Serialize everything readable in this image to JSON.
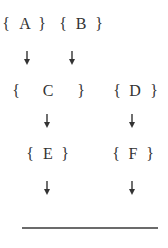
{
  "diagram": {
    "type": "flow",
    "nodes": [
      {
        "id": "A",
        "label": "A",
        "open": "{",
        "close": "}"
      },
      {
        "id": "B",
        "label": "B",
        "open": "{",
        "close": "}"
      },
      {
        "id": "C",
        "label": "C",
        "open": "{",
        "close": "}"
      },
      {
        "id": "D",
        "label": "D",
        "open": "{",
        "close": "}"
      },
      {
        "id": "E",
        "label": "E",
        "open": "{",
        "close": "}"
      },
      {
        "id": "F",
        "label": "F",
        "open": "{",
        "close": "}"
      }
    ],
    "edges": [
      {
        "from": "A",
        "to": "C"
      },
      {
        "from": "B",
        "to": "C"
      },
      {
        "from": "C",
        "to": "E"
      },
      {
        "from": "D",
        "to": "F"
      },
      {
        "from": "E",
        "to": "baseline"
      },
      {
        "from": "F",
        "to": "baseline"
      }
    ],
    "colors": {
      "text": "#333333",
      "line": "#6b6b6b",
      "background": "#ffffff"
    }
  }
}
